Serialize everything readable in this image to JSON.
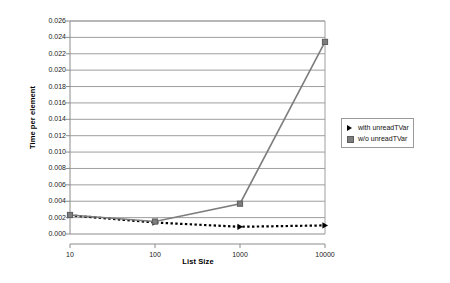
{
  "chart_data": {
    "type": "line",
    "title": "",
    "xlabel": "List Size",
    "ylabel": "Time per element",
    "xscale": "log",
    "x": [
      10,
      100,
      1000,
      10000
    ],
    "xticklabels": [
      "10",
      "100",
      "1000",
      "10000"
    ],
    "ylim": [
      0.0,
      0.026
    ],
    "yticks": [
      0.0,
      0.002,
      0.004,
      0.006,
      0.008,
      0.01,
      0.012,
      0.014,
      0.016,
      0.018,
      0.02,
      0.022,
      0.024,
      0.026
    ],
    "yticklabels": [
      "0.000",
      "0.002",
      "0.004",
      "0.006",
      "0.008",
      "0.010",
      "0.012",
      "0.014",
      "0.016",
      "0.018",
      "0.020",
      "0.022",
      "0.024",
      "0.026"
    ],
    "grid": "horizontal",
    "legend_position": "right",
    "series": [
      {
        "name": "with unreadTVar",
        "values": [
          0.00228,
          0.0014,
          0.00088,
          0.00105
        ],
        "color": "#000000",
        "linestyle": "dotted",
        "marker": "triangle"
      },
      {
        "name": "w/o unreadTVar",
        "values": [
          0.00232,
          0.00152,
          0.0037,
          0.02345
        ],
        "color": "#7d7d7d",
        "linestyle": "solid",
        "marker": "square"
      }
    ]
  },
  "legend": {
    "entries": [
      {
        "label": "with unreadTVar"
      },
      {
        "label": "w/o unreadTVar"
      }
    ]
  }
}
